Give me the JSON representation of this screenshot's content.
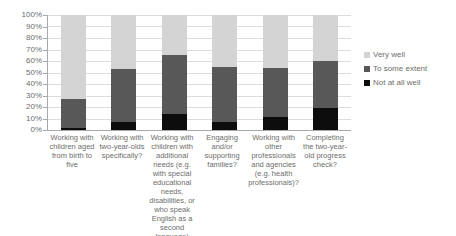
{
  "chart_data": {
    "type": "bar",
    "subtype": "stacked-bar-100-percent",
    "title": "",
    "xlabel": "",
    "ylabel": "",
    "ylim": [
      0,
      100
    ],
    "ytick_labels": [
      "100%",
      "90%",
      "80%",
      "70%",
      "60%",
      "50%",
      "40%",
      "30%",
      "20%",
      "10%",
      "0%"
    ],
    "ytick_values": [
      100,
      90,
      80,
      70,
      60,
      50,
      40,
      30,
      20,
      10,
      0
    ],
    "grid": true,
    "legend_position": "right",
    "categories": [
      "Working with children aged from birth to five",
      "Working with two-year-olds specifically?",
      "Working with children with additional needs (e.g. with special educational needs, disabilities, or who speak English as a second language)",
      "Engaging and/or supporting families?",
      "Working with other professionals and agencies (e.g. health professionals)?",
      "Completing the two-year-old progress check?"
    ],
    "series": [
      {
        "name": "Very well",
        "color": "#d4d4d4",
        "values": [
          73,
          47,
          35,
          45,
          46,
          40
        ]
      },
      {
        "name": "To some extent",
        "color": "#585858",
        "values": [
          25,
          46,
          51,
          48,
          43,
          41
        ]
      },
      {
        "name": "Not at all well",
        "color": "#0d0d0d",
        "values": [
          2,
          7,
          14,
          7,
          11,
          19
        ]
      }
    ]
  },
  "legend": {
    "items": [
      {
        "label": "Very well",
        "color": "#d4d4d4"
      },
      {
        "label": "To some extent",
        "color": "#585858"
      },
      {
        "label": "Not at all well",
        "color": "#0d0d0d"
      }
    ]
  }
}
